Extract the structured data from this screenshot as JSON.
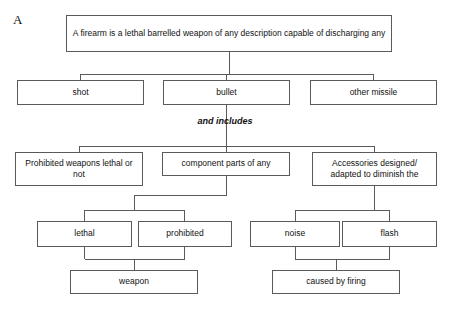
{
  "figure": {
    "label": "A",
    "connector_phrase": "and includes",
    "line_color": "#5a5a5a",
    "box_border_color": "#5a5a5a",
    "box_fill_color": "#ffffff",
    "text_color": "#111111"
  },
  "nodes": {
    "root": "A firearm is a lethal barrelled weapon of any description capable of discharging any",
    "shot": "shot",
    "bullet": "bullet",
    "other_missile": "other missile",
    "prohibited_weapons": "Prohibited weapons lethal or not",
    "component_parts": "component parts of any",
    "accessories": "Accessories designed/ adapted to diminish the",
    "lethal": "lethal",
    "prohibited": "prohibited",
    "noise": "noise",
    "flash": "flash",
    "weapon": "weapon",
    "caused_by_firing": "caused by firing"
  }
}
